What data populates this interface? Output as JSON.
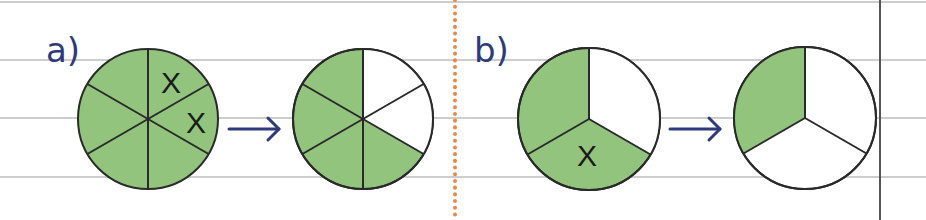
{
  "colors": {
    "fill": "#93c47d",
    "empty": "#ffffff",
    "stroke": "#2a2a2a",
    "label": "#2e3a7a",
    "arrow": "#2e3a7a",
    "rule": "#bdbdbd",
    "divider_dotted": "#e8894a",
    "margin_line": "#555555"
  },
  "parts": [
    {
      "label": "a)",
      "before": {
        "slices": 6,
        "shaded": 6,
        "crossed_slices": 2,
        "cross_glyph": "X"
      },
      "after": {
        "slices": 6,
        "shaded": 4
      },
      "arrow": "→"
    },
    {
      "label": "b)",
      "before": {
        "slices": 3,
        "shaded": 2,
        "crossed_slices": 1,
        "cross_glyph": "X"
      },
      "after": {
        "slices": 3,
        "shaded": 1
      },
      "arrow": "→"
    }
  ]
}
